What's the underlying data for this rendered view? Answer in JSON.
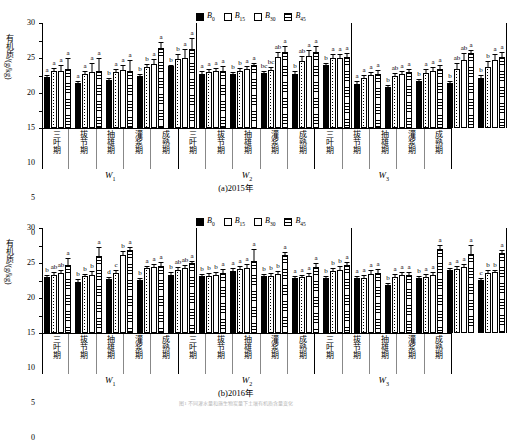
{
  "figure": {
    "caption": "图1 不同灌水量和施生物炭量下土壤有机质含量变化"
  },
  "legend": {
    "position": "top-center",
    "items": [
      {
        "label": "B",
        "sub": "0",
        "pattern": "solid-black"
      },
      {
        "label": "B",
        "sub": "15",
        "pattern": "dotted"
      },
      {
        "label": "B",
        "sub": "30",
        "pattern": "white"
      },
      {
        "label": "B",
        "sub": "45",
        "pattern": "horizontal-lines"
      }
    ]
  },
  "axis": {
    "ylabel": "有机质/(g/kg)",
    "yticks": [
      0,
      5,
      10,
      15,
      20,
      25,
      30
    ],
    "ylim": [
      0,
      30
    ],
    "stages": [
      "三叶期",
      "拔节期",
      "抽雄期",
      "灌浆期",
      "成熟期"
    ],
    "wgroups": [
      {
        "label": "W",
        "sub": "1"
      },
      {
        "label": "W",
        "sub": "2"
      },
      {
        "label": "W",
        "sub": "3"
      }
    ]
  },
  "panels": [
    {
      "id": "a",
      "caption": "(a)2015年"
    },
    {
      "id": "b",
      "caption": "(b)2016年"
    }
  ],
  "chart_data": [
    {
      "type": "bar",
      "panel": "a",
      "title": "(a)2015年",
      "xlabel": "",
      "ylabel": "有机质/(g/kg)",
      "ylim": [
        0,
        30
      ],
      "yticks": [
        0,
        5,
        10,
        15,
        20,
        25,
        30
      ],
      "grid": false,
      "legend_position": "top-center",
      "group_labels": [
        "W1",
        "W2",
        "W3"
      ],
      "categories": [
        "三叶期",
        "拔节期",
        "抽雄期",
        "灌浆期",
        "成熟期"
      ],
      "series": [
        {
          "name": "B0",
          "values": [
            14.5,
            12.9,
            13.8,
            14.8,
            17.6,
            15.3,
            15.3,
            15.7,
            15.5,
            18.1,
            12.7,
            11.7,
            13.5,
            12.9,
            14.4
          ],
          "errors": [
            1.0,
            0.9,
            0.9,
            1.0,
            0.7,
            1.4,
            0.9,
            1.0,
            1.0,
            0.9,
            0.9,
            0.9,
            0.9,
            0.9,
            1.0
          ],
          "sig": [
            "a",
            "a",
            "b",
            "b",
            "b",
            "a",
            "b",
            "bc",
            "b",
            "b",
            "a",
            "b",
            "b",
            "b",
            "b"
          ]
        },
        {
          "name": "B15",
          "values": [
            16.3,
            15.3,
            16.0,
            17.3,
            19.8,
            16.1,
            16.3,
            16.5,
            19.1,
            19.9,
            14.4,
            15.0,
            15.8,
            17.0,
            17.5
          ],
          "errors": [
            1.0,
            1.2,
            1.1,
            1.3,
            1.6,
            1.0,
            1.0,
            1.1,
            1.7,
            1.4,
            1.0,
            1.1,
            1.4,
            1.9,
            1.9
          ],
          "sig": [
            "a",
            "a",
            "a",
            "b",
            "b",
            "a",
            "b",
            "bc",
            "ab",
            "a",
            "a",
            "ab",
            "a",
            "ab",
            "b"
          ]
        },
        {
          "name": "B30",
          "values": [
            16.4,
            16.1,
            16.5,
            18.3,
            20.0,
            16.4,
            16.8,
            20.2,
            20.5,
            20.1,
            15.1,
            15.3,
            16.2,
            19.4,
            19.3
          ],
          "errors": [
            1.8,
            2.7,
            1.9,
            1.6,
            3.0,
            1.1,
            1.2,
            1.8,
            2.0,
            1.2,
            1.1,
            1.2,
            1.6,
            2.2,
            2.2
          ],
          "sig": [
            "a",
            "a",
            "a",
            "a",
            "a",
            "a",
            "a",
            "ab",
            "a",
            "a",
            "a",
            "a",
            "a",
            "ab",
            "a"
          ]
        },
        {
          "name": "B45",
          "values": [
            16.8,
            16.2,
            16.3,
            22.8,
            22.6,
            16.4,
            18.0,
            21.8,
            21.6,
            20.3,
            15.5,
            16.0,
            17.0,
            21.3,
            20.4
          ],
          "errors": [
            3.4,
            4.2,
            3.5,
            2.0,
            3.4,
            1.7,
            0.9,
            1.8,
            2.1,
            1.3,
            1.3,
            1.1,
            1.3,
            1.4,
            1.7
          ],
          "sig": [
            "a",
            "a",
            "a",
            "a",
            "a",
            "a",
            "a",
            "a",
            "a",
            "a",
            "a",
            "a",
            "a",
            "a",
            "a"
          ]
        }
      ]
    },
    {
      "type": "bar",
      "panel": "b",
      "title": "(b)2016年",
      "xlabel": "",
      "ylabel": "有机质/(g/kg)",
      "ylim": [
        0,
        30
      ],
      "yticks": [
        0,
        5,
        10,
        15,
        20,
        25,
        30
      ],
      "grid": false,
      "legend_position": "top-center",
      "group_labels": [
        "W1",
        "W2",
        "W3"
      ],
      "categories": [
        "三叶期",
        "拔节期",
        "抽雄期",
        "灌浆期",
        "成熟期"
      ],
      "series": [
        {
          "name": "B0",
          "values": [
            16.1,
            14.7,
            15.5,
            15.1,
            16.5,
            16.2,
            17.7,
            16.3,
            15.6,
            15.7,
            15.6,
            13.7,
            15.6,
            18.1,
            15.1
          ],
          "errors": [
            0.9,
            0.9,
            0.9,
            0.9,
            1.1,
            0.9,
            1.1,
            0.9,
            0.9,
            0.9,
            0.9,
            0.9,
            1.0,
            0.8,
            0.9
          ],
          "sig": [
            "b",
            "b",
            "d",
            "b",
            "b",
            "b",
            "a",
            "b",
            "a",
            "b",
            "a",
            "b",
            "b",
            "a",
            "c"
          ]
        },
        {
          "name": "B15",
          "values": [
            16.7,
            16.2,
            17.2,
            18.5,
            18.0,
            16.4,
            18.3,
            16.3,
            16.0,
            17.8,
            15.8,
            16.1,
            16.1,
            18.3,
            17.2
          ],
          "errors": [
            1.1,
            1.0,
            1.2,
            1.0,
            1.1,
            1.0,
            1.2,
            1.0,
            1.0,
            1.1,
            1.0,
            1.1,
            1.0,
            1.0,
            1.0
          ],
          "sig": [
            "ab",
            "b",
            "c",
            "a",
            "ab",
            "b",
            "a",
            "b",
            "a",
            "b",
            "a",
            "a",
            "a",
            "a",
            "b"
          ]
        },
        {
          "name": "B30",
          "values": [
            17.2,
            16.5,
            22.4,
            18.9,
            18.6,
            16.5,
            18.7,
            16.8,
            16.4,
            18.1,
            17.0,
            16.6,
            16.6,
            18.9,
            17.3
          ],
          "errors": [
            1.2,
            1.4,
            1.4,
            1.2,
            1.1,
            1.1,
            1.3,
            1.1,
            1.1,
            1.2,
            1.2,
            1.2,
            1.1,
            1.0,
            1.1
          ],
          "sig": [
            "ab",
            "b",
            "b",
            "a",
            "ab",
            "b",
            "a",
            "b",
            "a",
            "b",
            "a",
            "a",
            "a",
            "a",
            "b"
          ]
        },
        {
          "name": "B45",
          "values": [
            19.3,
            22.1,
            23.8,
            19.2,
            20.0,
            17.1,
            20.7,
            22.2,
            19.0,
            19.3,
            17.1,
            16.6,
            24.1,
            22.5,
            22.8
          ],
          "errors": [
            2.3,
            2.7,
            1.2,
            1.4,
            1.0,
            1.4,
            3.5,
            1.2,
            1.4,
            1.2,
            1.4,
            1.2,
            1.4,
            2.9,
            1.2
          ],
          "sig": [
            "a",
            "a",
            "a",
            "a",
            "a",
            "a",
            "a",
            "a",
            "a",
            "a",
            "a",
            "a",
            "a",
            "a",
            "a"
          ]
        }
      ]
    }
  ]
}
